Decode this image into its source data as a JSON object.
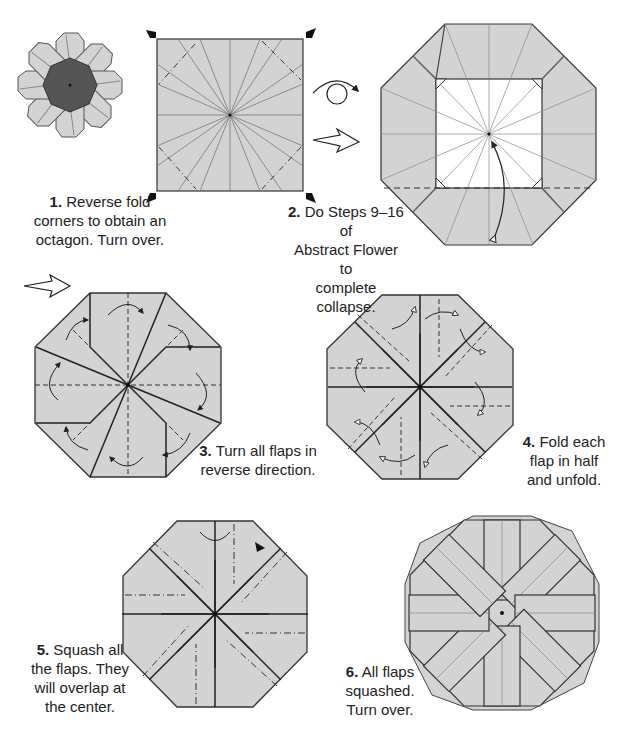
{
  "colors": {
    "paper": "#d3d3d3",
    "paper_dark": "#555555",
    "line": "#222222",
    "crease": "#777777",
    "background": "#ffffff"
  },
  "steps": [
    {
      "number": "1.",
      "text_lines": [
        "Reverse fold",
        "corners to obtain an",
        "octagon. Turn over."
      ]
    },
    {
      "number": "2.",
      "text_lines": [
        "Do Steps 9–16 of",
        "Abstract Flower to",
        "complete collapse."
      ]
    },
    {
      "number": "3.",
      "text_lines": [
        "Turn all flaps in",
        "reverse direction."
      ]
    },
    {
      "number": "4.",
      "text_lines": [
        "Fold each",
        "flap in half",
        "and unfold."
      ]
    },
    {
      "number": "5.",
      "text_lines": [
        "Squash all",
        "the flaps. They",
        "will overlap at",
        "the center."
      ]
    },
    {
      "number": "6.",
      "text_lines": [
        "All flaps",
        "squashed.",
        "Turn over."
      ]
    }
  ],
  "icons": [
    "turn-over-icon",
    "next-step-arrow-icon",
    "reverse-fold-marker-icon",
    "valley-fold-arrow-icon",
    "flower-preview-icon"
  ]
}
